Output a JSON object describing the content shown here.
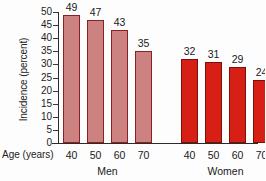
{
  "chart_data": {
    "type": "bar",
    "title": "",
    "subtitle": "",
    "xlabel": "Age (years)",
    "ylabel": "Incidence (percent)",
    "ylim": [
      0,
      50
    ],
    "ytick_step": 5,
    "yticks": [
      "50",
      "45",
      "40",
      "35",
      "30",
      "25",
      "20",
      "15",
      "10",
      "5",
      "0"
    ],
    "grid": false,
    "legend": "none",
    "categories": [
      "40",
      "50",
      "60",
      "70"
    ],
    "groups": [
      {
        "name": "Men",
        "color": "#cc8280",
        "border_color": "#8a2320",
        "categories": [
          "40",
          "50",
          "60",
          "70"
        ],
        "values": [
          49,
          47,
          43,
          35
        ]
      },
      {
        "name": "Women",
        "color": "#d81f15",
        "border_color": "#7a120c",
        "categories": [
          "40",
          "50",
          "60",
          "70"
        ],
        "values": [
          32,
          31,
          29,
          24
        ]
      }
    ],
    "bars": [
      {
        "group": "Men",
        "category": "40",
        "value": 49,
        "label": "49",
        "series": "men"
      },
      {
        "group": "Men",
        "category": "50",
        "value": 47,
        "label": "47",
        "series": "men"
      },
      {
        "group": "Men",
        "category": "60",
        "value": 43,
        "label": "43",
        "series": "men"
      },
      {
        "group": "Men",
        "category": "70",
        "value": 35,
        "label": "35",
        "series": "men"
      },
      {
        "group": "Women",
        "category": "40",
        "value": 32,
        "label": "32",
        "series": "women"
      },
      {
        "group": "Women",
        "category": "50",
        "value": 31,
        "label": "31",
        "series": "women"
      },
      {
        "group": "Women",
        "category": "60",
        "value": 29,
        "label": "29",
        "series": "women"
      },
      {
        "group": "Women",
        "category": "70",
        "value": 24,
        "label": "24",
        "series": "women"
      }
    ]
  },
  "axes": {
    "y_label": "Incidence (percent)",
    "x_label_lead": "Age (years)",
    "y_tick_labels": [
      "50",
      "45",
      "40",
      "35",
      "30",
      "25",
      "20",
      "15",
      "10",
      "5",
      "0"
    ],
    "x_tick_labels": [
      "40",
      "50",
      "60",
      "70",
      "40",
      "50",
      "60",
      "70"
    ],
    "group_labels": [
      "Men",
      "Women"
    ]
  },
  "colors": {
    "men_fill": "#cc8280",
    "men_border": "#8a2320",
    "women_fill": "#d81f15",
    "women_border": "#7a120c",
    "axis": "#2b2b2b",
    "text": "#1a1a1a",
    "background": "#fdfdfd"
  }
}
